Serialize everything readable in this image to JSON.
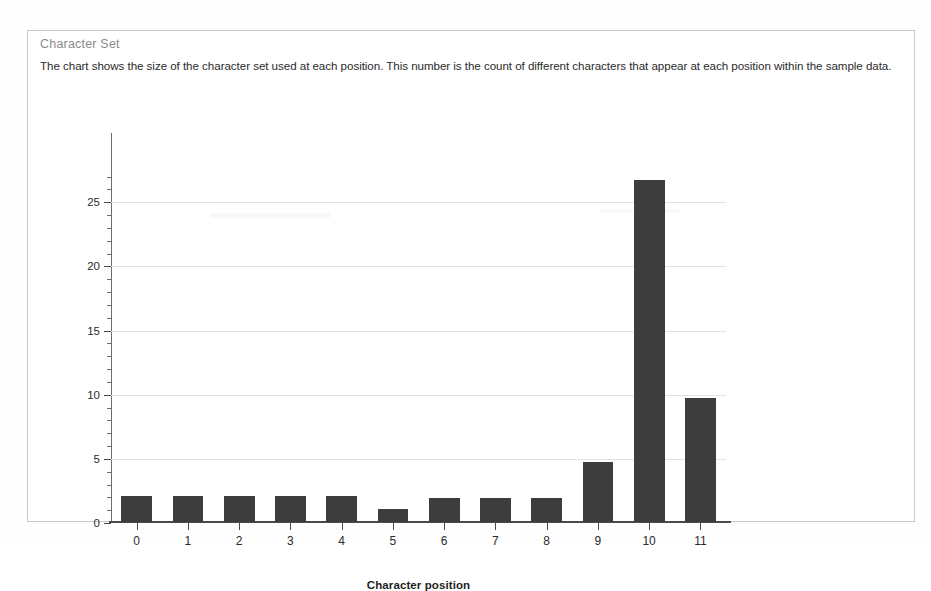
{
  "panel": {
    "title": "Character Set",
    "description": "The chart shows the size of the character set used at each position. This number is the count of different characters that appear at each position within the sample data."
  },
  "chart_data": {
    "type": "bar",
    "title": "Character Set",
    "xlabel": "Character position",
    "ylabel": "",
    "categories": [
      "0",
      "1",
      "2",
      "3",
      "4",
      "5",
      "6",
      "7",
      "8",
      "9",
      "10",
      "11"
    ],
    "values": [
      2,
      2,
      2,
      2,
      2,
      1,
      1.9,
      1.9,
      1.9,
      4.7,
      26.7,
      9.7
    ],
    "ylim": [
      0,
      29
    ],
    "yticks": [
      "0",
      "5",
      "10",
      "15",
      "20",
      "25"
    ],
    "ytick_values": [
      0,
      5,
      10,
      15,
      20,
      25
    ],
    "minor_tick_step": 1,
    "grid": true,
    "legend": false,
    "bar_color": "#3d3d3d",
    "grid_color": "#e2e2e2",
    "axis_color": "#4a4a4a"
  }
}
